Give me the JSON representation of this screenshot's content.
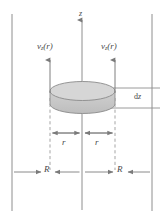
{
  "figure": {
    "type": "physics-diagram",
    "width": 165,
    "height": 221,
    "background_color": "#ffffff",
    "line_color": "#6e6e6e",
    "dashed_color": "#9a9a9a",
    "disk_fill_color": "#c9c9c9",
    "disk_top_fill_color": "#d4d4d4",
    "disk_edge_color": "#8a8a8a",
    "label_color": "#4a4a4a",
    "partial_top_text": "·  ·"
  },
  "labels": {
    "axis_z": "z",
    "velocity_left": "v",
    "velocity_left_sub": "z",
    "velocity_left_arg": "(r)",
    "velocity_right": "v",
    "velocity_right_sub": "z",
    "velocity_right_arg": "(r)",
    "thickness_d": "d",
    "thickness_z": "z",
    "radius_left": "r",
    "radius_right": "r",
    "pipe_radius_left": "R",
    "pipe_radius_right": "R"
  },
  "geometry": {
    "center_x": 82,
    "left_wall_x": 12,
    "right_wall_x": 152,
    "disk_left_x": 50,
    "disk_right_x": 115,
    "disk_top_y": 86,
    "disk_bottom_y": 112,
    "axis_top_y": 18,
    "axis_bottom_y": 210,
    "r_dim_y": 133,
    "R_dim_y": 172
  }
}
